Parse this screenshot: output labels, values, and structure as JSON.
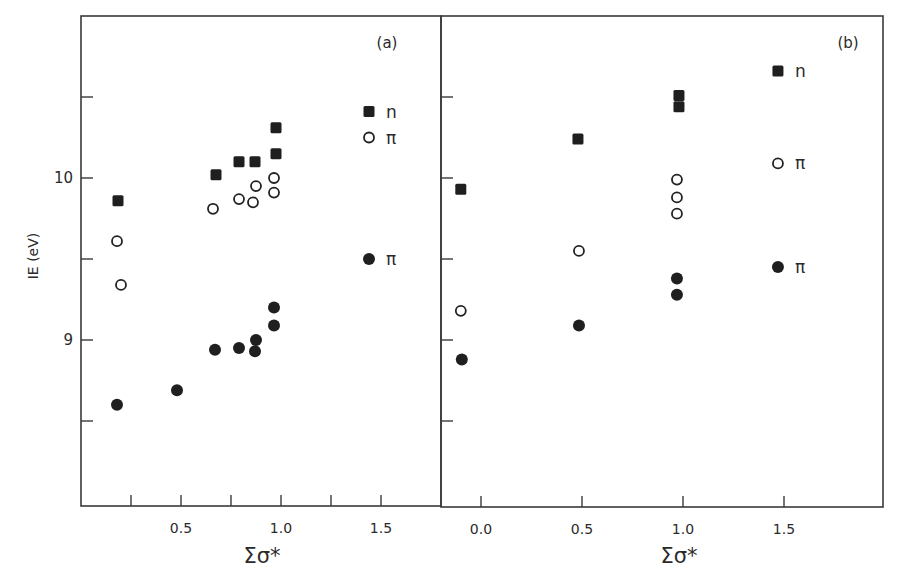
{
  "chart_data": [
    {
      "panel": "a",
      "type": "scatter",
      "panel_label": "(a)",
      "title": "",
      "xlabel": "Σσ*",
      "ylabel": "IE (eV)",
      "xlim": [
        0.0,
        1.8
      ],
      "ylim": [
        8.0,
        10.95
      ],
      "xticks": [
        0.25,
        0.5,
        0.75,
        1.0,
        1.25,
        1.5
      ],
      "xtick_labels": [
        {
          "value": 0.5,
          "label": "0.5"
        },
        {
          "value": 1.0,
          "label": "1.0"
        },
        {
          "value": 1.5,
          "label": "1.5"
        }
      ],
      "yticks": [
        8.5,
        9.0,
        9.5,
        10.0,
        10.5
      ],
      "ytick_labels": [
        {
          "value": 9.0,
          "label": "9"
        },
        {
          "value": 10.0,
          "label": "10"
        }
      ],
      "grid": false,
      "series": [
        {
          "name": "n",
          "marker": "filled-square",
          "points": [
            [
              0.185,
              9.86
            ],
            [
              0.675,
              10.02
            ],
            [
              0.79,
              10.1
            ],
            [
              0.87,
              10.1
            ],
            [
              0.975,
              10.31
            ],
            [
              0.975,
              10.15
            ]
          ]
        },
        {
          "name": "π (open)",
          "marker": "open-circle",
          "points": [
            [
              0.18,
              9.61
            ],
            [
              0.2,
              9.34
            ],
            [
              0.66,
              9.81
            ],
            [
              0.79,
              9.87
            ],
            [
              0.86,
              9.85
            ],
            [
              0.875,
              9.95
            ],
            [
              0.965,
              10.0
            ],
            [
              0.965,
              9.91
            ]
          ]
        },
        {
          "name": "π (filled)",
          "marker": "filled-circle",
          "points": [
            [
              0.18,
              8.6
            ],
            [
              0.48,
              8.69
            ],
            [
              0.67,
              8.94
            ],
            [
              0.79,
              8.95
            ],
            [
              0.87,
              8.93
            ],
            [
              0.875,
              9.0
            ],
            [
              0.965,
              9.2
            ],
            [
              0.965,
              9.09
            ]
          ]
        }
      ],
      "legend": [
        {
          "marker": "filled-square",
          "label": "n",
          "x": 1.44,
          "y": 10.41
        },
        {
          "marker": "open-circle",
          "label": "π",
          "x": 1.44,
          "y": 10.25
        },
        {
          "marker": "filled-circle",
          "label": "π",
          "x": 1.44,
          "y": 9.5
        }
      ]
    },
    {
      "panel": "b",
      "type": "scatter",
      "panel_label": "(b)",
      "title": "",
      "xlabel": "Σσ*",
      "ylabel": "IE (eV)",
      "xlim": [
        -0.2,
        2.0
      ],
      "ylim": [
        8.0,
        10.95
      ],
      "xticks": [
        0.0,
        0.5,
        1.0,
        1.5
      ],
      "xtick_labels": [
        {
          "value": 0.0,
          "label": "0.0"
        },
        {
          "value": 0.5,
          "label": "0.5"
        },
        {
          "value": 1.0,
          "label": "1.0"
        },
        {
          "value": 1.5,
          "label": "1.5"
        }
      ],
      "yticks": [
        8.5,
        9.0,
        9.5,
        10.0,
        10.5
      ],
      "ytick_labels": [],
      "grid": false,
      "series": [
        {
          "name": "n",
          "marker": "filled-square",
          "points": [
            [
              -0.1,
              9.93
            ],
            [
              0.48,
              10.24
            ],
            [
              0.98,
              10.51
            ],
            [
              0.98,
              10.44
            ]
          ]
        },
        {
          "name": "π (open)",
          "marker": "open-circle",
          "points": [
            [
              -0.1,
              9.18
            ],
            [
              0.485,
              9.55
            ],
            [
              0.97,
              9.99
            ],
            [
              0.97,
              9.88
            ],
            [
              0.97,
              9.78
            ]
          ]
        },
        {
          "name": "π (filled)",
          "marker": "filled-circle",
          "points": [
            [
              -0.095,
              8.88
            ],
            [
              0.485,
              9.09
            ],
            [
              0.97,
              9.38
            ],
            [
              0.97,
              9.28
            ]
          ]
        }
      ],
      "legend": [
        {
          "marker": "filled-square",
          "label": "n",
          "x": 1.47,
          "y": 10.66
        },
        {
          "marker": "open-circle",
          "label": "π",
          "x": 1.47,
          "y": 10.09
        },
        {
          "marker": "filled-circle",
          "label": "π",
          "x": 1.47,
          "y": 9.45
        }
      ]
    }
  ],
  "layout": {
    "y_axis_label": "IE (eV)",
    "x_axis_label_a": "Σσ*",
    "x_axis_label_b": "Σσ*",
    "panel_a_label": "(a)",
    "panel_b_label": "(b)"
  }
}
